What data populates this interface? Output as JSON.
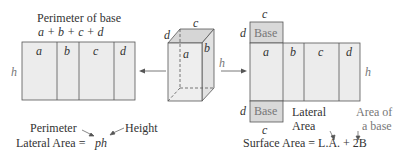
{
  "left_net": {
    "title": "Perimeter of base",
    "formula": "a + b + c + d",
    "faces": [
      "a",
      "b",
      "c",
      "d"
    ],
    "height_label": "h"
  },
  "lateral_formula": {
    "perimeter_label": "Perimeter",
    "height_label": "Height",
    "lhs": "Lateral Area =",
    "rhs": "ph"
  },
  "prism": {
    "labels": {
      "top": "c",
      "left_top": "d",
      "front": "a",
      "side": "b",
      "height": "h"
    }
  },
  "right_net": {
    "top_label": "c",
    "bottom_label": "c",
    "base_label": "Base",
    "d_top": "d",
    "d_bottom": "d",
    "faces": [
      "a",
      "b",
      "c",
      "d"
    ],
    "height_label": "h"
  },
  "surface_formula": {
    "lateral_label_1": "Lateral",
    "lateral_label_2": "Area",
    "base_label_1": "Area of",
    "base_label_2": "a base",
    "equation": "Surface Area = L.A. + 2B"
  },
  "colors": {
    "face_fill": "#ececec",
    "base_fill": "#d9d9d9",
    "stroke": "#555555"
  }
}
